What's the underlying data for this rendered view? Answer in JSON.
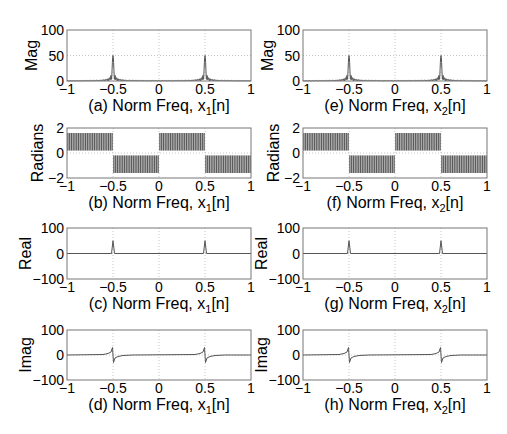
{
  "figure": {
    "width": 507,
    "height": 434,
    "columns": [
      {
        "left": 67,
        "width": 184
      },
      {
        "left": 303,
        "width": 184
      }
    ],
    "rows": [
      {
        "top": 30,
        "height": 51
      },
      {
        "top": 128,
        "height": 50
      },
      {
        "top": 228,
        "height": 51
      },
      {
        "top": 330,
        "height": 50
      }
    ],
    "colors": {
      "line": "#555555",
      "axis": "#777777",
      "grid": "#b8b8b8",
      "text": "#000000",
      "band": "#3a3a3a"
    }
  },
  "chart_data": [
    {
      "id": "a",
      "type": "line",
      "row": 0,
      "col": 0,
      "caption_prefix": "(a) Norm Freq, x",
      "caption_sub": "1",
      "caption_suffix": "[n]",
      "xlabel": "(a) Norm Freq, x1[n]",
      "ylabel": "Mag",
      "xlim": [
        -1,
        1
      ],
      "ylim": [
        0,
        100
      ],
      "xticks": [
        -1,
        -0.5,
        0,
        0.5,
        1
      ],
      "xtick_labels": [
        "−1",
        "−0.5",
        "0",
        "0.5",
        "1"
      ],
      "yticks": [
        0,
        50,
        100
      ],
      "ytick_labels": [
        "0",
        "50",
        "100"
      ],
      "grid": true,
      "kind": "magnitude",
      "peaks": [
        {
          "x": -0.5,
          "y": 50
        },
        {
          "x": 0.5,
          "y": 50
        }
      ]
    },
    {
      "id": "b",
      "type": "line",
      "row": 1,
      "col": 0,
      "caption_prefix": "(b) Norm Freq, x",
      "caption_sub": "1",
      "caption_suffix": "[n]",
      "xlabel": "(b) Norm Freq, x1[n]",
      "ylabel": "Radians",
      "xlim": [
        -1,
        1
      ],
      "ylim": [
        -2,
        2
      ],
      "xticks": [
        -1,
        -0.5,
        0,
        0.5,
        1
      ],
      "xtick_labels": [
        "−1",
        "−0.5",
        "0",
        "0.5",
        "1"
      ],
      "yticks": [
        -2,
        0,
        2
      ],
      "ytick_labels": [
        "−2",
        "0",
        "2"
      ],
      "grid": true,
      "kind": "phase",
      "bands": [
        {
          "x0": -1,
          "x1": -0.5,
          "ylow": 0.2,
          "yhigh": 1.6
        },
        {
          "x0": -0.5,
          "x1": 0,
          "ylow": -1.6,
          "yhigh": -0.2
        },
        {
          "x0": 0,
          "x1": 0.5,
          "ylow": 0.2,
          "yhigh": 1.6
        },
        {
          "x0": 0.5,
          "x1": 1,
          "ylow": -1.6,
          "yhigh": -0.2
        }
      ]
    },
    {
      "id": "c",
      "type": "line",
      "row": 2,
      "col": 0,
      "caption_prefix": "(c) Norm Freq, x",
      "caption_sub": "1",
      "caption_suffix": "[n]",
      "xlabel": "(c) Norm Freq, x1[n]",
      "ylabel": "Real",
      "xlim": [
        -1,
        1
      ],
      "ylim": [
        -100,
        100
      ],
      "xticks": [
        -1,
        -0.5,
        0,
        0.5,
        1
      ],
      "xtick_labels": [
        "−1",
        "−0.5",
        "0",
        "0.5",
        "1"
      ],
      "yticks": [
        -100,
        0,
        100
      ],
      "ytick_labels": [
        "−100",
        "0",
        "100"
      ],
      "grid": true,
      "kind": "real",
      "peaks": [
        {
          "x": -0.5,
          "y": 50
        },
        {
          "x": 0.5,
          "y": 50
        }
      ]
    },
    {
      "id": "d",
      "type": "line",
      "row": 3,
      "col": 0,
      "caption_prefix": "(d) Norm Freq, x",
      "caption_sub": "1",
      "caption_suffix": "[n]",
      "xlabel": "(d) Norm Freq, x1[n]",
      "ylabel": "Imag",
      "xlim": [
        -1,
        1
      ],
      "ylim": [
        -100,
        100
      ],
      "xticks": [
        -1,
        -0.5,
        0,
        0.5,
        1
      ],
      "xtick_labels": [
        "−1",
        "−0.5",
        "0",
        "0.5",
        "1"
      ],
      "yticks": [
        -100,
        0,
        100
      ],
      "ytick_labels": [
        "−100",
        "0",
        "100"
      ],
      "grid": true,
      "kind": "imag",
      "peaks": [
        {
          "x": -0.5,
          "y_max": 30,
          "y_min": -30
        },
        {
          "x": 0.5,
          "y_max": 30,
          "y_min": -30
        }
      ]
    },
    {
      "id": "e",
      "type": "line",
      "row": 0,
      "col": 1,
      "caption_prefix": "(e) Norm Freq, x",
      "caption_sub": "2",
      "caption_suffix": "[n]",
      "xlabel": "(e) Norm Freq, x2[n]",
      "ylabel": "Mag",
      "xlim": [
        -1,
        1
      ],
      "ylim": [
        0,
        100
      ],
      "xticks": [
        -1,
        -0.5,
        0,
        0.5,
        1
      ],
      "xtick_labels": [
        "−1",
        "−0.5",
        "0",
        "0.5",
        "1"
      ],
      "yticks": [
        0,
        50,
        100
      ],
      "ytick_labels": [
        "0",
        "50",
        "100"
      ],
      "grid": true,
      "kind": "magnitude",
      "peaks": [
        {
          "x": -0.5,
          "y": 50
        },
        {
          "x": 0.5,
          "y": 50
        }
      ]
    },
    {
      "id": "f",
      "type": "line",
      "row": 1,
      "col": 1,
      "caption_prefix": "(f) Norm Freq, x",
      "caption_sub": "2",
      "caption_suffix": "[n]",
      "xlabel": "(f) Norm Freq, x2[n]",
      "ylabel": "Radians",
      "xlim": [
        -1,
        1
      ],
      "ylim": [
        -2,
        2
      ],
      "xticks": [
        -1,
        -0.5,
        0,
        0.5,
        1
      ],
      "xtick_labels": [
        "−1",
        "−0.5",
        "0",
        "0.5",
        "1"
      ],
      "yticks": [
        -2,
        0,
        2
      ],
      "ytick_labels": [
        "−2",
        "0",
        "2"
      ],
      "grid": true,
      "kind": "phase",
      "bands": [
        {
          "x0": -1,
          "x1": -0.5,
          "ylow": 0.2,
          "yhigh": 1.6
        },
        {
          "x0": -0.5,
          "x1": 0,
          "ylow": -1.6,
          "yhigh": -0.2
        },
        {
          "x0": 0,
          "x1": 0.5,
          "ylow": 0.2,
          "yhigh": 1.6
        },
        {
          "x0": 0.5,
          "x1": 1,
          "ylow": -1.6,
          "yhigh": -0.2
        }
      ]
    },
    {
      "id": "g",
      "type": "line",
      "row": 2,
      "col": 1,
      "caption_prefix": "(g) Norm Freq, x",
      "caption_sub": "2",
      "caption_suffix": "[n]",
      "xlabel": "(g) Norm Freq, x2[n]",
      "ylabel": "Real",
      "xlim": [
        -1,
        1
      ],
      "ylim": [
        -100,
        100
      ],
      "xticks": [
        -1,
        -0.5,
        0,
        0.5,
        1
      ],
      "xtick_labels": [
        "−1",
        "−0.5",
        "0",
        "0.5",
        "1"
      ],
      "yticks": [
        -100,
        0,
        100
      ],
      "ytick_labels": [
        "−100",
        "0",
        "100"
      ],
      "grid": true,
      "kind": "real",
      "peaks": [
        {
          "x": -0.5,
          "y": 50
        },
        {
          "x": 0.5,
          "y": 50
        }
      ]
    },
    {
      "id": "h",
      "type": "line",
      "row": 3,
      "col": 1,
      "caption_prefix": "(h) Norm Freq, x",
      "caption_sub": "2",
      "caption_suffix": "[n]",
      "xlabel": "(h) Norm Freq, x2[n]",
      "ylabel": "Imag",
      "xlim": [
        -1,
        1
      ],
      "ylim": [
        -100,
        100
      ],
      "xticks": [
        -1,
        -0.5,
        0,
        0.5,
        1
      ],
      "xtick_labels": [
        "−1",
        "−0.5",
        "0",
        "0.5",
        "1"
      ],
      "yticks": [
        -100,
        0,
        100
      ],
      "ytick_labels": [
        "−100",
        "0",
        "100"
      ],
      "grid": true,
      "kind": "imag",
      "peaks": [
        {
          "x": -0.5,
          "y_max": 30,
          "y_min": -30
        },
        {
          "x": 0.5,
          "y_max": 30,
          "y_min": -30
        }
      ]
    }
  ]
}
